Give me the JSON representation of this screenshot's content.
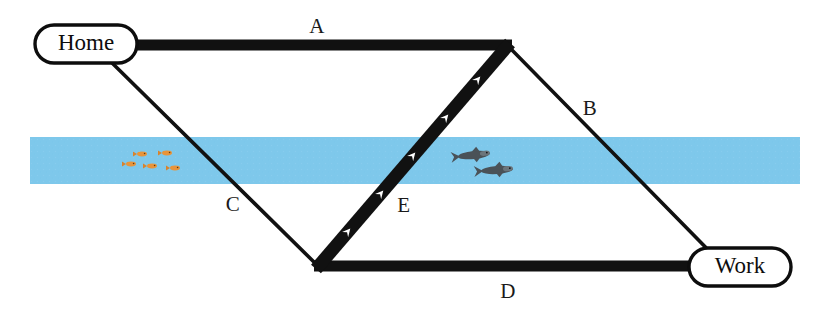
{
  "diagram": {
    "background_color": "#ffffff",
    "width": 825,
    "height": 323,
    "nodes": [
      {
        "id": "home",
        "label": "Home",
        "x": 86,
        "y": 44,
        "rx": 51,
        "ry": 19
      },
      {
        "id": "work",
        "label": "Work",
        "x": 740,
        "y": 267,
        "rx": 51,
        "ry": 19
      }
    ],
    "junctions": [
      {
        "id": "top_right",
        "x": 508,
        "y": 45
      },
      {
        "id": "bottom_left",
        "x": 318,
        "y": 266
      }
    ],
    "edges": [
      {
        "id": "A",
        "label": "A",
        "label_x": 317,
        "label_y": 28,
        "from": "home",
        "to": "top_right",
        "style": "thick",
        "stroke_width": 11,
        "color": "#111111",
        "has_arrows": false
      },
      {
        "id": "B",
        "label": "B",
        "label_x": 590,
        "label_y": 110,
        "from": "top_right",
        "to": "work",
        "style": "thin",
        "stroke_width": 3.5,
        "color": "#111111",
        "has_arrows": false
      },
      {
        "id": "C",
        "label": "C",
        "label_x": 233,
        "label_y": 206,
        "from": "home",
        "to": "bottom_left",
        "style": "thin",
        "stroke_width": 3.5,
        "color": "#111111",
        "has_arrows": false
      },
      {
        "id": "D",
        "label": "D",
        "label_x": 508,
        "label_y": 293,
        "from": "bottom_left",
        "to": "work",
        "style": "thick",
        "stroke_width": 11,
        "color": "#111111",
        "has_arrows": false
      },
      {
        "id": "E",
        "label": "E",
        "label_x": 404,
        "label_y": 207,
        "from": "bottom_left",
        "to": "top_right",
        "style": "thick",
        "stroke_width": 11,
        "color": "#111111",
        "has_arrows": true,
        "arrow_count": 5,
        "arrow_color": "#ffffff"
      }
    ],
    "river": {
      "name": "river-band",
      "color": "#7ec8eb",
      "x": 30,
      "y": 137,
      "width": 770,
      "height": 47
    },
    "small_fish": {
      "name": "orange-fish-school",
      "color": "#e8943a",
      "count": 5,
      "positions": [
        {
          "x": 142,
          "y": 154
        },
        {
          "x": 167,
          "y": 153
        },
        {
          "x": 131,
          "y": 164
        },
        {
          "x": 152,
          "y": 166
        },
        {
          "x": 175,
          "y": 168
        }
      ]
    },
    "large_fish": {
      "name": "predator-fish-pair",
      "color": "#4a5258",
      "count": 2,
      "positions": [
        {
          "x": 474,
          "y": 155
        },
        {
          "x": 497,
          "y": 170
        }
      ]
    }
  }
}
